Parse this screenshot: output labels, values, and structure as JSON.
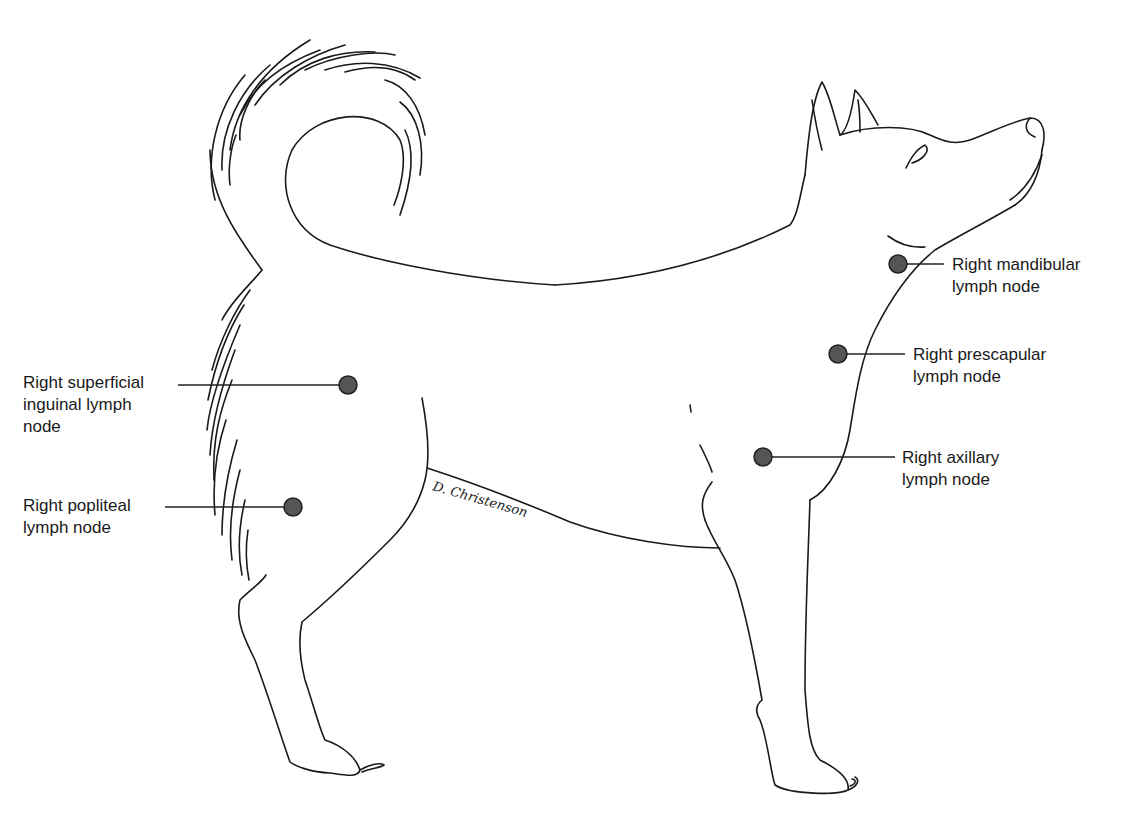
{
  "figure": {
    "signature": "D. Christenson",
    "colors": {
      "outline": "#1a1a1a",
      "node_fill": "#555555",
      "node_stroke": "#222222",
      "leader": "#222222",
      "background": "#ffffff"
    }
  },
  "labels": [
    {
      "id": "mandibular",
      "text": "Right mandibular\nlymph node"
    },
    {
      "id": "prescapular",
      "text": "Right prescapular\nlymph node"
    },
    {
      "id": "axillary",
      "text": "Right axillary\nlymph node"
    },
    {
      "id": "superficial-inguinal",
      "text": "Right superficial\ninguinal lymph\nnode"
    },
    {
      "id": "popliteal",
      "text": "Right popliteal\nlymph node"
    }
  ]
}
